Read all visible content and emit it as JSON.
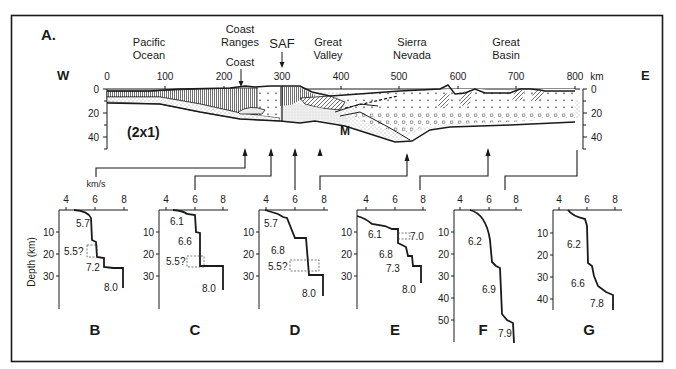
{
  "figure": {
    "panel_label": "A.",
    "west_label": "W",
    "east_label": "E",
    "scale_note": "(2x1)",
    "moho_label": "M",
    "unit_km": "km",
    "velocity_unit": "km/s",
    "regions": [
      {
        "name": "pacific",
        "line1": "Pacific",
        "line2": "Ocean"
      },
      {
        "name": "coast-ranges",
        "line1": "Coast",
        "line2": "Ranges"
      },
      {
        "name": "coast",
        "line1": "Coast"
      },
      {
        "name": "saf",
        "line1": "SAF"
      },
      {
        "name": "great-valley",
        "line1": "Great",
        "line2": "Valley"
      },
      {
        "name": "sierra-nevada",
        "line1": "Sierra",
        "line2": "Nevada"
      },
      {
        "name": "great-basin",
        "line1": "Great",
        "line2": "Basin"
      }
    ],
    "x_ticks": [
      "0",
      "100",
      "200",
      "300",
      "400",
      "500",
      "600",
      "700",
      "800"
    ],
    "depth_ticks_left": [
      "0",
      "20",
      "40"
    ],
    "depth_ticks_right": [
      "0",
      "20",
      "40"
    ]
  },
  "profiles": {
    "depth_axis_title": "Depth (km)",
    "velocity_ticks": [
      "4",
      "6",
      "8"
    ],
    "items": [
      {
        "label": "B",
        "depth_ticks": [
          "10",
          "20",
          "30"
        ],
        "velocities": [
          "5.7",
          "5.5?",
          "7.2",
          "8.0"
        ]
      },
      {
        "label": "C",
        "depth_ticks": [
          "10",
          "20",
          "30"
        ],
        "velocities": [
          "6.1",
          "6.6",
          "5.5?",
          "8.0"
        ]
      },
      {
        "label": "D",
        "depth_ticks": [
          "10",
          "20",
          "30"
        ],
        "velocities": [
          "5.7",
          "6.8",
          "5.5?",
          "8.0"
        ]
      },
      {
        "label": "E",
        "depth_ticks": [
          "10",
          "20",
          "30"
        ],
        "velocities": [
          "6.1",
          "7.0",
          "6.8",
          "7.3",
          "8.0"
        ]
      },
      {
        "label": "F",
        "depth_ticks": [
          "10",
          "20",
          "30",
          "40",
          "50"
        ],
        "velocities": [
          "6.2",
          "6.9",
          "7.9"
        ]
      },
      {
        "label": "G",
        "depth_ticks": [
          "10",
          "20",
          "30",
          "40"
        ],
        "velocities": [
          "6.2",
          "6.6",
          "7.8"
        ]
      }
    ]
  }
}
